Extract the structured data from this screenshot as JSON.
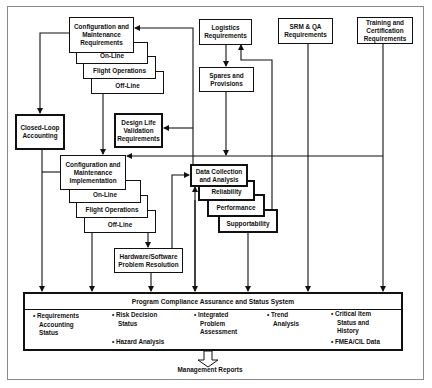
{
  "diagram": {
    "boxes": {
      "config_maint_req": "Configuration and Maintenance Requirements",
      "config_maint_req_stack": [
        "On-Line",
        "Flight Operations",
        "Off-Line"
      ],
      "logistics_req": "Logistics Requirements",
      "spares_provisions": "Spares and Provisions",
      "srm_qa_req": "SRM & QA Requirements",
      "training_cert_req": "Training and Certification Requirements",
      "closed_loop": "Closed-Loop Accounting",
      "design_life": "Design Life Validation Requirements",
      "config_maint_impl": "Configuration and Maintenance Implementation",
      "config_maint_impl_stack": [
        "On-Line",
        "Flight Operations",
        "Off-Line"
      ],
      "hw_sw": "Hardware/Software Problem Resolution",
      "data_collection": "Data Collection and Analysis",
      "data_collection_stack": [
        "Reliability",
        "Performance",
        "Supportability"
      ]
    },
    "pcass": {
      "title": "Program Compliance Assurance and Status System",
      "items": [
        {
          "lines": [
            "• Requirements",
            "Accounting",
            "Status"
          ]
        },
        {
          "lines": [
            "• Risk Decision",
            "Status"
          ]
        },
        {
          "lines": [
            "• Hazard Analysis"
          ]
        },
        {
          "lines": [
            "• Integrated",
            "Problem",
            "Assessment"
          ]
        },
        {
          "lines": [
            "• Trend",
            "Analysis"
          ]
        },
        {
          "lines": [
            "• Critical Item",
            "Status and",
            "History"
          ]
        },
        {
          "lines": [
            "• FMEA/CIL Data"
          ]
        }
      ]
    },
    "output_label": "Management Reports"
  }
}
